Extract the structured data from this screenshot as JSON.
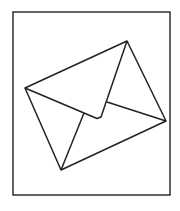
{
  "figure": {
    "icon": "envelope-icon",
    "stroke_color": "#222222",
    "background_color": "#ffffff",
    "frame": {
      "x": 13,
      "y": 12,
      "width": 157,
      "height": 183
    },
    "envelope": {
      "outline": [
        [
          25,
          88
        ],
        [
          127,
          41
        ],
        [
          166,
          121
        ],
        [
          61,
          170
        ]
      ],
      "flap": [
        [
          25,
          88
        ],
        [
          97,
          118.5
        ],
        [
          101,
          117
        ],
        [
          127,
          41
        ]
      ],
      "left_fold": [
        [
          84,
          113
        ],
        [
          61,
          170
        ]
      ],
      "right_fold": [
        [
          107,
          102
        ],
        [
          166,
          121
        ]
      ]
    }
  }
}
